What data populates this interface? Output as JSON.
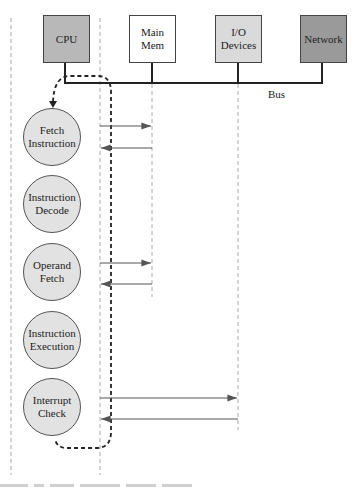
{
  "components": [
    {
      "id": "cpu",
      "label": "CPU",
      "fill": "#b8b8b8",
      "x": 43,
      "y": 15
    },
    {
      "id": "main-mem",
      "label": "Main\nMem",
      "fill": "#ffffff",
      "x": 129,
      "y": 15
    },
    {
      "id": "io-devices",
      "label": "I/O\nDevices",
      "fill": "#dadada",
      "x": 215,
      "y": 15
    },
    {
      "id": "network",
      "label": "Network",
      "fill": "#9a9a9a",
      "x": 300,
      "y": 15
    }
  ],
  "bus": {
    "label": "Bus"
  },
  "steps": [
    {
      "id": "fetch-instruction",
      "label": "Fetch\nInstruction",
      "cy": 137
    },
    {
      "id": "instruction-decode",
      "label": "Instruction\nDecode",
      "cy": 204
    },
    {
      "id": "operand-fetch",
      "label": "Operand\nFetch",
      "cy": 272
    },
    {
      "id": "instruction-execution",
      "label": "Instruction\nExecution",
      "cy": 340
    },
    {
      "id": "interrupt-check",
      "label": "Interrupt\nCheck",
      "cy": 407
    }
  ],
  "messages": [
    {
      "from": "cpu",
      "to": "main-mem",
      "y": 126
    },
    {
      "from": "main-mem",
      "to": "cpu",
      "y": 148
    },
    {
      "from": "cpu",
      "to": "main-mem",
      "y": 263
    },
    {
      "from": "main-mem",
      "to": "cpu",
      "y": 284
    },
    {
      "from": "cpu",
      "to": "io-devices",
      "y": 398
    },
    {
      "from": "io-devices",
      "to": "cpu",
      "y": 419
    }
  ],
  "colors": {
    "line": "#222222",
    "arrow": "#555555",
    "dashed": "#aaaaaa",
    "loop": "#222222"
  }
}
